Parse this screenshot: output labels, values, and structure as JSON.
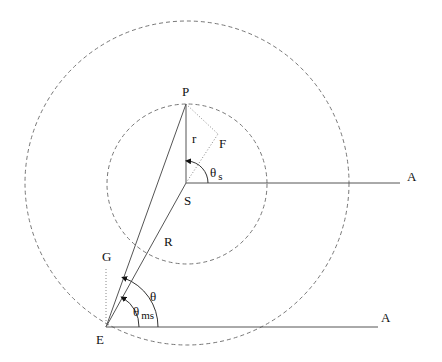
{
  "diagram": {
    "points": {
      "P": {
        "label": "P",
        "x": 186,
        "y": 104
      },
      "S": {
        "label": "S",
        "x": 186,
        "y": 183
      },
      "E": {
        "label": "E",
        "x": 106,
        "y": 327
      },
      "F_corner": {
        "x": 218,
        "y": 134
      }
    },
    "labels": {
      "P": "P",
      "S": "S",
      "E": "E",
      "G": "G",
      "F": "F",
      "r": "r",
      "R": "R",
      "A_top": "A",
      "A_bottom": "A",
      "theta": "θ",
      "theta_s": "θ",
      "theta_s_sub": "s",
      "theta_ms": "θ",
      "theta_ms_sub": "ms"
    },
    "circles": [
      {
        "name": "outer-orbit",
        "cx": 187,
        "cy": 183,
        "r": 162,
        "style": "dashed"
      },
      {
        "name": "inner-orbit",
        "cx": 187,
        "cy": 184,
        "r": 80,
        "style": "dashed"
      }
    ],
    "stroke_color": "#555555",
    "dashed_color": "#777777"
  }
}
